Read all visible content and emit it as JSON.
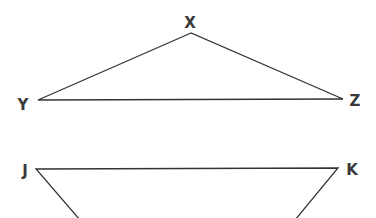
{
  "diagram": {
    "triangle": {
      "vertices": [
        {
          "label": "X",
          "x": 191,
          "y": 33,
          "lx": 190,
          "ly": 28
        },
        {
          "label": "Y",
          "x": 38,
          "y": 100,
          "lx": 23,
          "ly": 110
        },
        {
          "label": "Z",
          "x": 343,
          "y": 99,
          "lx": 355,
          "ly": 106
        }
      ]
    },
    "trapezoid": {
      "vertices": [
        {
          "label": "J",
          "x": 36,
          "y": 169,
          "lx": 25,
          "ly": 176
        },
        {
          "label": "K",
          "x": 338,
          "y": 168,
          "lx": 352,
          "ly": 175
        }
      ],
      "bottom_left": {
        "x": 80,
        "y": 220
      },
      "bottom_right": {
        "x": 295,
        "y": 220
      }
    }
  }
}
